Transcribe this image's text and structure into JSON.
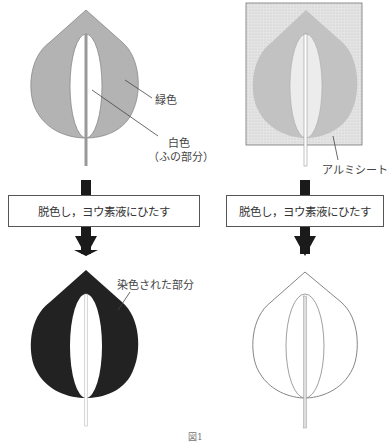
{
  "figure": {
    "caption": "図1",
    "left": {
      "labels": {
        "green": "緑色",
        "white_line1": "白色",
        "white_line2": "（ふの部分）",
        "stained": "染色された部分"
      },
      "step_box": "脱色し，ヨウ素液にひたす"
    },
    "right": {
      "labels": {
        "foil": "アルミシート"
      },
      "step_box": "脱色し，ヨウ素液にひたす"
    },
    "colors": {
      "green_area": "#b3b3b3",
      "stained_area": "#222222",
      "foil": "#d8d8d8",
      "arrow": "#1a1a1a",
      "outline": "#777777"
    }
  }
}
